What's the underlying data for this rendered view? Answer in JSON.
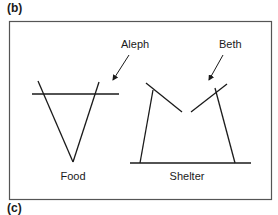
{
  "panels": {
    "top_label": "(b)",
    "bottom_label": "(c)"
  },
  "diagram": {
    "frame_color": "#555555",
    "stroke_color": "#1a1a1a",
    "figures": [
      {
        "name": "Food",
        "label": "Food",
        "callout": "Aleph"
      },
      {
        "name": "Shelter",
        "label": "Shelter",
        "callout": "Beth"
      }
    ]
  }
}
